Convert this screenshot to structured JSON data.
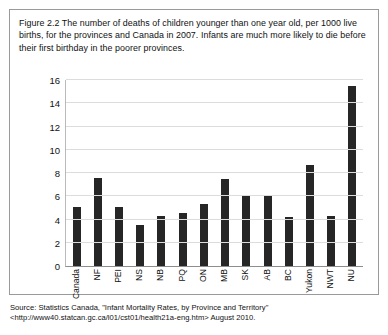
{
  "figure": {
    "caption": "Figure 2.2 The number of deaths of children younger than one year old, per 1000 live births, for the provinces and Canada in 2007. Infants are much more likely to die before their first birthday in the poorer provinces.",
    "source_note": "Source: Statistics Canada, \"Infant Mortality Rates, by Province and Territory\" <http://www40.statcan.gc.ca/l01/cst01/health21a-eng.htm> August 2010."
  },
  "chart_data": {
    "type": "bar",
    "title": "",
    "xlabel": "",
    "ylabel": "",
    "ylim": [
      0,
      16
    ],
    "yticks": [
      0,
      2,
      4,
      6,
      8,
      10,
      12,
      14,
      16
    ],
    "ytick_labels": [
      "0",
      "2",
      "4",
      "6",
      "8",
      "10",
      "12",
      "14",
      "16"
    ],
    "grid": true,
    "legend": "none",
    "bar_color": "#262626",
    "categories": [
      "Canada",
      "NF",
      "PEI",
      "NS",
      "NB",
      "PQ",
      "ON",
      "MB",
      "SK",
      "AB",
      "BC",
      "Yukon",
      "NWT",
      "NU"
    ],
    "values": [
      5.1,
      7.6,
      5.1,
      3.5,
      4.3,
      4.6,
      5.3,
      7.5,
      6.0,
      6.1,
      4.2,
      8.7,
      4.3,
      15.5
    ]
  }
}
